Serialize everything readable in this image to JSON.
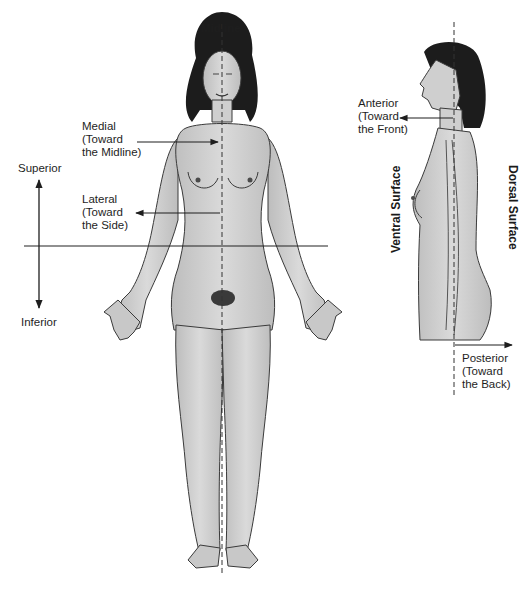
{
  "diagram": {
    "labels": {
      "midline": "Midline",
      "medial": [
        "Medial",
        "(Toward",
        "the Midline)"
      ],
      "lateral": [
        "Lateral",
        "(Toward",
        "the Side)"
      ],
      "superior": "Superior",
      "inferior": "Inferior",
      "anterior": [
        "Anterior",
        "(Toward",
        "the Front)"
      ],
      "posterior": [
        "Posterior",
        "(Toward",
        "the Back)"
      ],
      "ventral_surface": "Ventral Surface",
      "dorsal_surface": "Dorsal Surface"
    },
    "figures": [
      {
        "name": "front-view-figure",
        "view": "anterior"
      },
      {
        "name": "side-view-figure",
        "view": "lateral profile"
      }
    ],
    "colors": {
      "skin": "#d2d2d2",
      "skin_shade": "#b8b8b8",
      "hair": "#1c1c1c",
      "line": "#2a2a2a",
      "background": "#ffffff"
    }
  }
}
